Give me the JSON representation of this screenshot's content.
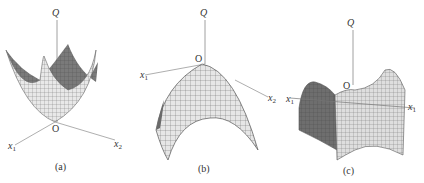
{
  "figure": {
    "panels": [
      {
        "id": "a",
        "surface": "convex-bowl (minimum at origin)",
        "caption": "(a)",
        "labels": {
          "vertical_axis": "Q",
          "origin": "O",
          "axis1": "x",
          "axis1_sub": "1",
          "axis2": "x",
          "axis2_sub": "2"
        }
      },
      {
        "id": "b",
        "surface": "concave-dome (maximum at origin)",
        "caption": "(b)",
        "labels": {
          "vertical_axis": "Q",
          "origin": "O",
          "axis1": "x",
          "axis1_sub": "1",
          "axis2": "x",
          "axis2_sub": "2"
        }
      },
      {
        "id": "c",
        "surface": "saddle (saddle point at origin)",
        "caption": "(c)",
        "labels": {
          "vertical_axis": "Q",
          "origin": "O",
          "axis1": "x",
          "axis1_sub": "1",
          "axis2": "x",
          "axis2_sub": "1"
        }
      }
    ],
    "colors": {
      "mesh_light": "#e6e6e6",
      "mesh_dark": "#6a6a6a",
      "grid_line": "#555555",
      "axis": "#888888"
    }
  }
}
